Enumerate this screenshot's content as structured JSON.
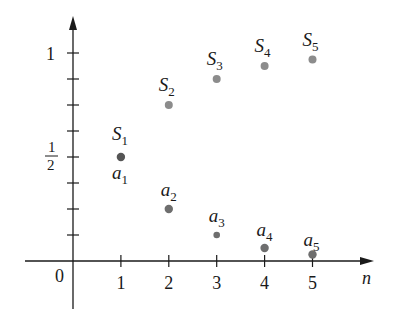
{
  "chart_data": {
    "type": "scatter",
    "title": "",
    "xlabel": "n",
    "ylabel": "",
    "xlim": [
      0,
      5
    ],
    "ylim": [
      0,
      1
    ],
    "x_ticks": [
      1,
      2,
      3,
      4,
      5
    ],
    "x_tick_labels": [
      "1",
      "2",
      "3",
      "4",
      "5"
    ],
    "y_minor_ticks": [
      0.125,
      0.25,
      0.375,
      0.5,
      0.625,
      0.75,
      0.875,
      1
    ],
    "y_tick_labels": [
      {
        "value": 0.5,
        "label_num": "1",
        "label_den": "2"
      },
      {
        "value": 1,
        "label": "1"
      }
    ],
    "origin_label": "0",
    "grid": false,
    "legend": null,
    "series": [
      {
        "name": "S_n (partial sums)",
        "label_prefix": "S",
        "x": [
          1,
          2,
          3,
          4,
          5
        ],
        "values": [
          0.5,
          0.75,
          0.875,
          0.9375,
          0.96875
        ],
        "color": "#8c8c8c",
        "first_point_color": "#555555"
      },
      {
        "name": "a_n (terms)",
        "label_prefix": "a",
        "x": [
          1,
          2,
          3,
          4,
          5
        ],
        "values": [
          0.5,
          0.25,
          0.125,
          0.0625,
          0.03125
        ],
        "color": "#6e6e6e"
      }
    ]
  },
  "labels": {
    "origin": "0",
    "x_axis_var": "n",
    "y_one": "1",
    "y_half_num": "1",
    "y_half_den": "2",
    "x_ticks": [
      "1",
      "2",
      "3",
      "4",
      "5"
    ],
    "s_labels": [
      {
        "base": "S",
        "sub": "1"
      },
      {
        "base": "S",
        "sub": "2"
      },
      {
        "base": "S",
        "sub": "3"
      },
      {
        "base": "S",
        "sub": "4"
      },
      {
        "base": "S",
        "sub": "5"
      }
    ],
    "a_labels": [
      {
        "base": "a",
        "sub": "1"
      },
      {
        "base": "a",
        "sub": "2"
      },
      {
        "base": "a",
        "sub": "3"
      },
      {
        "base": "a",
        "sub": "4"
      },
      {
        "base": "a",
        "sub": "5"
      }
    ]
  }
}
